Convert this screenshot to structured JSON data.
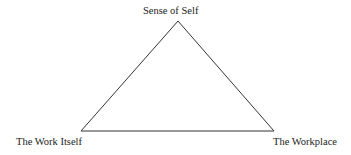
{
  "diagram": {
    "type": "triangle",
    "vertices": {
      "top": {
        "label": "Sense of Self"
      },
      "bottom_left": {
        "label": "The Work Itself"
      },
      "bottom_right": {
        "label": "The Workplace"
      }
    },
    "line_color": "#333333"
  }
}
